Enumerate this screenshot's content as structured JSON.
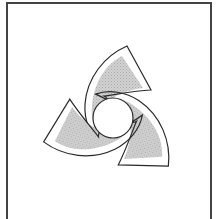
{
  "figure": {
    "blade_count": 3,
    "symmetry": "3-fold rotational (120 degrees)",
    "colors": {
      "frame": "#444444",
      "outline": "#2a2a2a",
      "fill": "#c8c8c8",
      "background": "#ffffff"
    },
    "blades": [
      {
        "name": "top-blade"
      },
      {
        "name": "left-blade"
      },
      {
        "name": "right-blade"
      }
    ]
  }
}
